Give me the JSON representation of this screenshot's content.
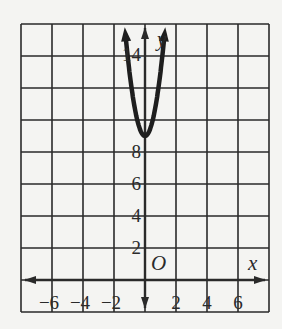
{
  "chart_data": {
    "type": "line",
    "title": "",
    "xlabel": "x",
    "ylabel": "y",
    "origin_label": "O",
    "function": "y = 4x^2 + 9",
    "xlim": [
      -8,
      8
    ],
    "ylim": [
      -2,
      16
    ],
    "grid": true,
    "grid_step": 2,
    "x_ticks": [
      -6,
      -4,
      -2,
      2,
      4,
      6
    ],
    "x_tick_labels": [
      "−6",
      "−4",
      "−2",
      "2",
      "4",
      "6"
    ],
    "y_ticks": [
      2,
      4,
      6,
      8,
      14
    ],
    "y_tick_labels": [
      "2",
      "4",
      "6",
      "8",
      "14"
    ],
    "series": [
      {
        "name": "parabola",
        "x": [
          -1.75,
          -1.5,
          -1.25,
          -1,
          -0.75,
          -0.5,
          -0.25,
          0,
          0.25,
          0.5,
          0.75,
          1,
          1.25,
          1.5,
          1.75
        ],
        "y": [
          21.25,
          18,
          15.25,
          13,
          11.25,
          10,
          9.25,
          9,
          9.25,
          10,
          11.25,
          13,
          15.25,
          18,
          21.25
        ]
      }
    ],
    "vertex": [
      0,
      9
    ],
    "colors": {
      "grid": "#2a2a2a",
      "curve": "#1e1e1e",
      "background": "#f4f4f2"
    }
  }
}
